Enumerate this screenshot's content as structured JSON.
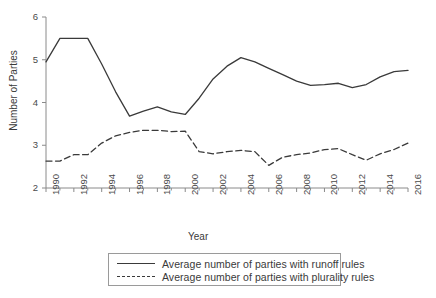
{
  "chart_data": {
    "type": "line",
    "title": "",
    "xlabel": "Year",
    "ylabel": "Number of Parties",
    "xlim": [
      1990,
      2016
    ],
    "ylim": [
      2,
      6
    ],
    "yticks": [
      2,
      3,
      4,
      5,
      6
    ],
    "xticks": [
      1990,
      1992,
      1994,
      1996,
      1998,
      2000,
      2002,
      2004,
      2006,
      2008,
      2010,
      2012,
      2014,
      2016
    ],
    "xtick_labels": [
      "1990",
      "1992",
      "1994",
      "1996",
      "1998",
      "2000",
      "2002",
      "2004",
      "2006",
      "2008",
      "2010",
      "2012",
      "2014",
      "2016"
    ],
    "ytick_labels": [
      "2",
      "3",
      "4",
      "5",
      "6"
    ],
    "grid": false,
    "legend_position": "below-center",
    "x": [
      1990,
      1991,
      1992,
      1993,
      1994,
      1995,
      1996,
      1997,
      1998,
      1999,
      2000,
      2001,
      2002,
      2003,
      2004,
      2005,
      2006,
      2007,
      2008,
      2009,
      2010,
      2011,
      2012,
      2013,
      2014,
      2015,
      2016
    ],
    "series": [
      {
        "name": "Average number of parties with runoff rules",
        "style": "solid",
        "color": "#3a3a3a",
        "values": [
          4.95,
          5.5,
          5.5,
          5.5,
          4.9,
          4.25,
          3.68,
          3.8,
          3.9,
          3.78,
          3.72,
          4.1,
          4.55,
          4.85,
          5.05,
          4.95,
          4.8,
          4.65,
          4.5,
          4.4,
          4.42,
          4.45,
          4.35,
          4.42,
          4.6,
          4.72,
          4.75
        ]
      },
      {
        "name": "Average number of parties with plurality rules",
        "style": "dashed",
        "color": "#3a3a3a",
        "values": [
          2.63,
          2.63,
          2.78,
          2.78,
          3.05,
          3.22,
          3.3,
          3.35,
          3.35,
          3.32,
          3.33,
          2.85,
          2.8,
          2.85,
          2.88,
          2.85,
          2.53,
          2.72,
          2.78,
          2.82,
          2.9,
          2.92,
          2.78,
          2.65,
          2.8,
          2.9,
          3.05
        ]
      }
    ]
  },
  "axes": {
    "xlabel": "Year",
    "ylabel": "Number of Parties"
  },
  "legend": {
    "entries": [
      {
        "label": "Average number of parties with runoff rules",
        "style": "solid"
      },
      {
        "label": "Average number of parties with plurality rules",
        "style": "dashed"
      }
    ]
  }
}
